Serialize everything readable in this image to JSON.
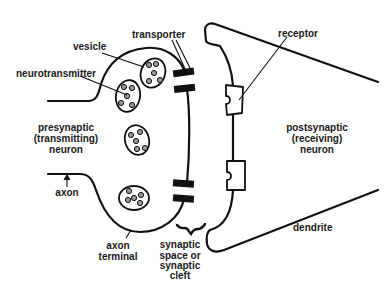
{
  "diagram": {
    "colors": {
      "stroke": "#111111",
      "background": "#ffffff",
      "text": "#1a1a1a"
    },
    "labels": {
      "transporter": "transporter",
      "vesicle": "vesicle",
      "neurotransmitter": "neurotransmitter",
      "receptor": "receptor",
      "presynaptic_line1": "presynaptic",
      "presynaptic_line2": "(transmitting)",
      "presynaptic_line3": "neuron",
      "postsynaptic_line1": "postsynaptic",
      "postsynaptic_line2": "(receiving)",
      "postsynaptic_line3": "neuron",
      "axon": "axon",
      "axon_terminal_line1": "axon",
      "axon_terminal_line2": "terminal",
      "cleft_line1": "synaptic",
      "cleft_line2": "space or",
      "cleft_line3": "synaptic",
      "cleft_line4": "cleft",
      "dendrite": "dendrite"
    },
    "components": {
      "vesicle_count": 4,
      "transporter_count": 2,
      "receptor_count": 2
    }
  }
}
